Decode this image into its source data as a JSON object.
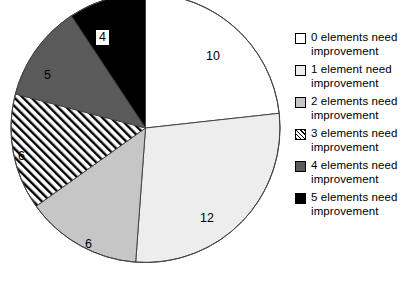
{
  "chart_data": {
    "type": "pie",
    "title": "",
    "xlabel": "",
    "ylabel": "",
    "total": 43,
    "legend_position": "right",
    "grid": false,
    "categories": [
      "0 elements need improvement",
      "1 element need improvement",
      "2 elements need improvement",
      "3 elements need improvement",
      "4 elements need improvement",
      "5 elements need improvement"
    ],
    "values": [
      10,
      12,
      6,
      6,
      5,
      4
    ],
    "slices": [
      {
        "label": "0 elements need improvement",
        "value": 10,
        "display_value": "10",
        "fill": "#ffffff",
        "pattern": "solid",
        "label_x": 206,
        "label_y": 50
      },
      {
        "label": "1 element need improvement",
        "value": 12,
        "display_value": "12",
        "fill": "#ededed",
        "pattern": "solid",
        "label_x": 200,
        "label_y": 212
      },
      {
        "label": "2 elements need improvement",
        "value": 6,
        "display_value": "6",
        "fill": "#c6c6c6",
        "pattern": "solid",
        "label_x": 85,
        "label_y": 238
      },
      {
        "label": "3 elements need improvement",
        "value": 6,
        "display_value": "6",
        "fill": "#ffffff",
        "pattern": "diagonal-hatch",
        "label_x": 18,
        "label_y": 150
      },
      {
        "label": "4 elements need improvement",
        "value": 5,
        "display_value": "5",
        "fill": "#5a5a5a",
        "pattern": "solid",
        "label_x": 44,
        "label_y": 69
      },
      {
        "label": "5 elements need improvement",
        "value": 4,
        "display_value": "4",
        "fill": "#000000",
        "pattern": "solid",
        "label_x": 98,
        "label_y": 32
      }
    ]
  },
  "legend": {
    "items": [
      {
        "label": "0 elements need\nimprovement",
        "swatch": "sw-white"
      },
      {
        "label": "1 element need\nimprovement",
        "swatch": "sw-light"
      },
      {
        "label": "2 elements need\nimprovement",
        "swatch": "sw-gray"
      },
      {
        "label": "3 elements need\nimprovement",
        "swatch": "sw-hatch"
      },
      {
        "label": "4 elements need\nimprovement",
        "swatch": "sw-dark"
      },
      {
        "label": "5 elements need\nimprovement",
        "swatch": "sw-black"
      }
    ]
  },
  "colors": {
    "outline": "#444444",
    "slice_0": "#ffffff",
    "slice_1": "#ededed",
    "slice_2": "#c6c6c6",
    "slice_3": "#ffffff",
    "slice_4": "#5a5a5a",
    "slice_5": "#000000"
  }
}
